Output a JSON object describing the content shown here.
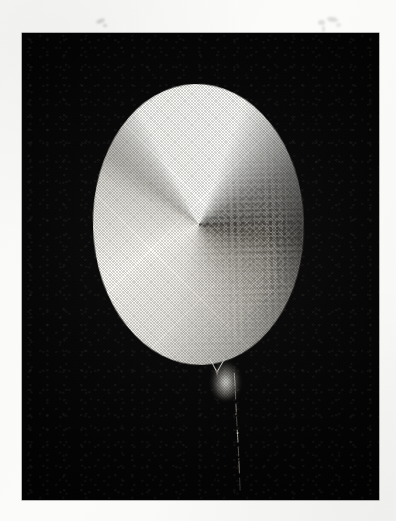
{
  "document": {
    "kind": "scanned-halftone-photograph",
    "page_background_color": "#fbfbfa",
    "plate_background_color": "#080707"
  },
  "plate": {
    "label": "photographic-plate",
    "x": 22,
    "y": 33,
    "width": 357,
    "height": 467,
    "border_color": "#000000"
  },
  "subject": {
    "name": "luminous balloon",
    "description": "Brightly lit oval balloon photographed against a black background, with a thin string hanging from its neck.",
    "shape": "ellipse",
    "center_x": 198,
    "center_y": 224,
    "width": 209,
    "height": 279,
    "rotation_deg": -1.6,
    "rim_highlight_color": "#f7f5ef",
    "body_light_color": "#aeaba3",
    "body_dark_color": "#191817",
    "tone_gradient": "dark at top, brightest toward lower-left",
    "neck": {
      "name": "balloon neck",
      "highlight_color": "#fffffa",
      "x": 203,
      "y": 347
    },
    "string": {
      "name": "hanging string",
      "color": "#b9b6ad",
      "start_x": 212,
      "start_y": 360,
      "end_x": 216,
      "end_y": 462,
      "appearance": "thin broken dotted line"
    }
  },
  "artifacts": {
    "name": "scan smudges",
    "description": "Faint grey specks and marks in the white page margin above the plate.",
    "count": 6,
    "color": "#78766f"
  },
  "caption": {
    "text": ""
  }
}
